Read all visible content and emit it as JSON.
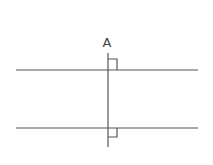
{
  "diagram": {
    "point_label": "A",
    "colors": {
      "line": "#555555",
      "text": "#444444",
      "background": "#ffffff"
    },
    "lines": [
      {
        "name": "top-parallel-line",
        "x1": 16,
        "y1": 70,
        "x2": 198,
        "y2": 70
      },
      {
        "name": "bottom-parallel-line",
        "x1": 16,
        "y1": 128,
        "x2": 198,
        "y2": 128
      },
      {
        "name": "transversal-line",
        "x1": 108,
        "y1": 53,
        "x2": 108,
        "y2": 147
      }
    ],
    "right_angle_markers": [
      {
        "name": "top-right-angle",
        "at": "top intersection",
        "side": "above-right"
      },
      {
        "name": "bottom-right-angle",
        "at": "bottom intersection",
        "side": "below-right"
      }
    ]
  }
}
